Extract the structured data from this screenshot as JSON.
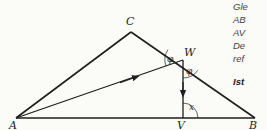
{
  "figure": {
    "vertices": {
      "A": "A",
      "B": "B",
      "C": "C",
      "W": "W",
      "V": "V"
    },
    "angles": {
      "phi_upper": "φ",
      "phi_lower": "φ",
      "x": "x"
    },
    "segments": [
      "AB",
      "BC",
      "CA",
      "AW",
      "WV"
    ],
    "arrows": [
      "A→W",
      "W→V"
    ]
  },
  "side_text": {
    "lines": [
      "Gle",
      "AB",
      "AV",
      "De",
      "ref"
    ],
    "question": "Ist"
  },
  "colors": {
    "ink": "#1e1e1e",
    "text_gray": "#444444",
    "background": "#fbfbf7"
  }
}
